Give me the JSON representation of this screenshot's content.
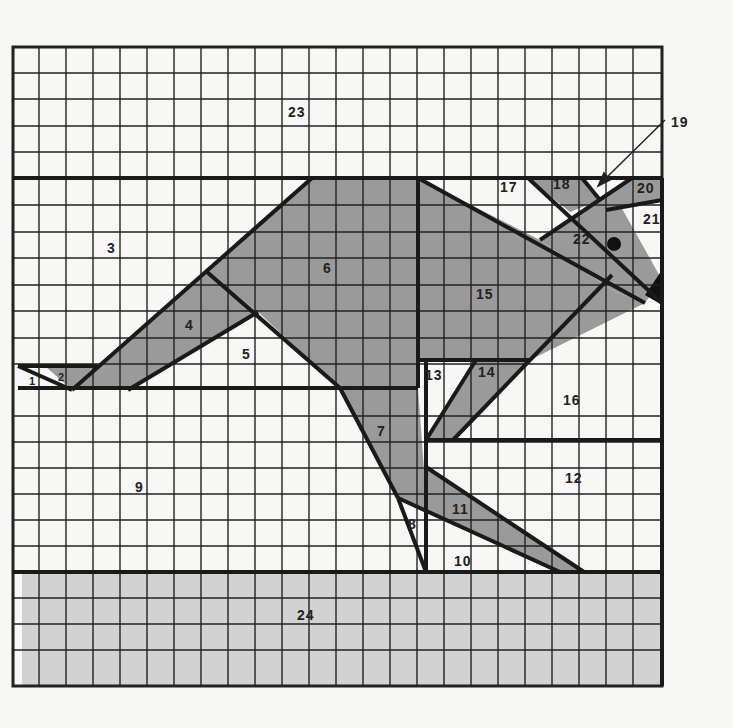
{
  "diagram": {
    "grid": {
      "columns": 24,
      "rows": 24,
      "origin_x": 12,
      "origin_y": 46,
      "cell_w": 27.05,
      "cell_h": 26.65
    },
    "colors": {
      "background": "#f7f7f5",
      "grid_line": "#222222",
      "kangaroo_fill": "#9a9a9a",
      "ground_fill": "#d2d2d2",
      "white": "#ffffff",
      "nose": "#111111"
    },
    "regions": [
      {
        "id": "1",
        "label": "1"
      },
      {
        "id": "2",
        "label": "2"
      },
      {
        "id": "3",
        "label": "3"
      },
      {
        "id": "4",
        "label": "4"
      },
      {
        "id": "5",
        "label": "5"
      },
      {
        "id": "6",
        "label": "6"
      },
      {
        "id": "7",
        "label": "7"
      },
      {
        "id": "8",
        "label": "8"
      },
      {
        "id": "9",
        "label": "9"
      },
      {
        "id": "10",
        "label": "10"
      },
      {
        "id": "11",
        "label": "11"
      },
      {
        "id": "12",
        "label": "12"
      },
      {
        "id": "13",
        "label": "13"
      },
      {
        "id": "14",
        "label": "14"
      },
      {
        "id": "15",
        "label": "15"
      },
      {
        "id": "16",
        "label": "16"
      },
      {
        "id": "17",
        "label": "17"
      },
      {
        "id": "18",
        "label": "18"
      },
      {
        "id": "19",
        "label": "19"
      },
      {
        "id": "20",
        "label": "20"
      },
      {
        "id": "21",
        "label": "21"
      },
      {
        "id": "22",
        "label": "22"
      },
      {
        "id": "23",
        "label": "23"
      },
      {
        "id": "24",
        "label": "24"
      }
    ]
  }
}
